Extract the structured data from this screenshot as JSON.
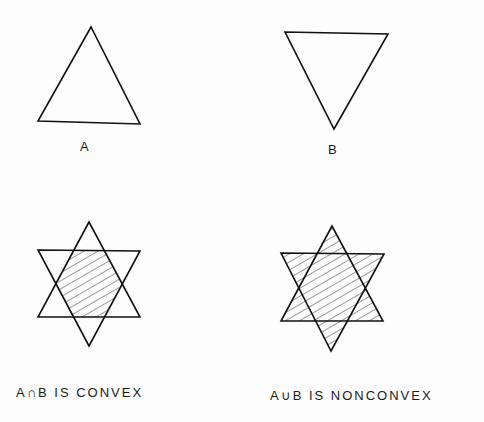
{
  "figure": {
    "panels": [
      {
        "id": "A",
        "label": "A",
        "shape": "upward triangle"
      },
      {
        "id": "B",
        "label": "B",
        "shape": "downward triangle"
      },
      {
        "id": "intersection",
        "label": "A∩B IS CONVEX",
        "shape": "hexagram with hatched hexagonal intersection"
      },
      {
        "id": "union",
        "label": "A∪B IS NONCONVEX",
        "shape": "hexagram fully hatched (union)"
      }
    ],
    "colors": {
      "stroke": "#111111",
      "background": "#fdfdfd",
      "hatch": "#222222"
    }
  }
}
